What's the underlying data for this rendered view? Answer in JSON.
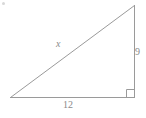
{
  "figure": {
    "kind": "right-triangle-diagram",
    "background_color": "#ffffff",
    "stroke_color": "#9a9a9a",
    "label_color": "#8a8a8a",
    "stroke_width": 1,
    "labels": {
      "hypotenuse": "x",
      "vertical_leg": "9",
      "horizontal_leg": "12"
    },
    "geometry": {
      "apex": {
        "x": 134,
        "y": 5
      },
      "left_vertex": {
        "x": 10,
        "y": 97
      },
      "right_angle_vertex": {
        "x": 134,
        "y": 97
      },
      "right_angle_marker_size": 8
    }
  }
}
